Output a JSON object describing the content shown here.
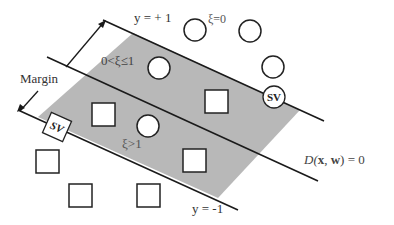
{
  "labels": {
    "margin": "Margin",
    "y_plus": "y = + 1",
    "y_minus": "y = -1",
    "xi_zero": "ξ=0",
    "xi_between": "0<ξ≤1",
    "xi_greater": "ξ>1",
    "decision_prefix": "D(",
    "decision_x": "x",
    "decision_sep": ", ",
    "decision_w": "w",
    "decision_suffix": ") = 0",
    "sv_top": "SV",
    "sv_left": "SV"
  },
  "colors": {
    "margin_band": "#b8b8b8",
    "line": "#1a1a1a",
    "shape_stroke": "#222222",
    "shape_fill": "#ffffff"
  },
  "shapes": {
    "circles": [
      {
        "cx": 196,
        "cy": 30,
        "r": 11
      },
      {
        "cx": 250,
        "cy": 31,
        "r": 11
      },
      {
        "cx": 273,
        "cy": 66,
        "r": 11
      },
      {
        "cx": 159,
        "cy": 67,
        "r": 11
      },
      {
        "cx": 148,
        "cy": 126,
        "r": 11
      }
    ],
    "squares": [
      {
        "x": 205,
        "y": 90,
        "s": 23
      },
      {
        "x": 92,
        "y": 103,
        "s": 23
      },
      {
        "x": 183,
        "y": 150,
        "s": 23
      },
      {
        "x": 36,
        "y": 150,
        "s": 23
      },
      {
        "x": 69,
        "y": 184,
        "s": 23
      },
      {
        "x": 137,
        "y": 184,
        "s": 23
      }
    ]
  }
}
